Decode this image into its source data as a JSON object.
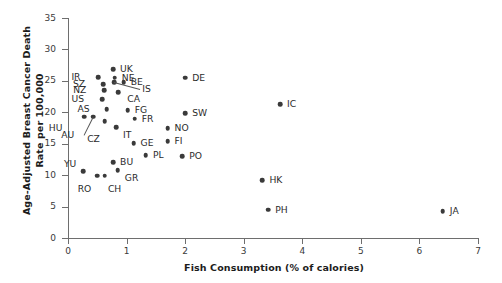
{
  "chart_data": {
    "type": "scatter",
    "title": "",
    "xlabel": "Fish Consumption (% of calories)",
    "ylabel_line1": "Age-Adjusted Breast Cancer Death",
    "ylabel_line2": "Rate per 100,000",
    "xlim": [
      0,
      7
    ],
    "ylim": [
      0,
      35
    ],
    "xticks": [
      "0",
      "1",
      "2",
      "3",
      "4",
      "5",
      "6",
      "7"
    ],
    "yticks": [
      "0",
      "5",
      "10",
      "15",
      "20",
      "25",
      "30",
      "35"
    ],
    "grid": false,
    "legend": "none",
    "marker_color": "#3a3a3a",
    "axis_color": "#6e6e6e",
    "points": [
      {
        "label": "UK",
        "x": 0.77,
        "y": 26.9,
        "lx": 7,
        "ly": -4
      },
      {
        "label": "IR",
        "x": 0.52,
        "y": 25.6,
        "lx": -18,
        "ly": -4
      },
      {
        "label": "NE",
        "x": 0.8,
        "y": 25.5,
        "lx": 7,
        "ly": -4
      },
      {
        "label": "BE",
        "x": 0.95,
        "y": 24.8,
        "lx": 7,
        "ly": -4
      },
      {
        "label": "SZ",
        "x": 0.6,
        "y": 24.5,
        "lx": -18,
        "ly": -4
      },
      {
        "label": "IS",
        "x": 0.79,
        "y": 24.8,
        "lx": 28,
        "ly": 3,
        "leader": true
      },
      {
        "label": "NZ",
        "x": 0.62,
        "y": 23.5,
        "lx": -18,
        "ly": -4
      },
      {
        "label": "CA",
        "x": 0.86,
        "y": 23.2,
        "lx": 9,
        "ly": 3
      },
      {
        "label": "US",
        "x": 0.58,
        "y": 22.1,
        "lx": -18,
        "ly": -4
      },
      {
        "label": "AS",
        "x": 0.66,
        "y": 20.5,
        "lx": -17,
        "ly": -4
      },
      {
        "label": "FG",
        "x": 1.02,
        "y": 20.3,
        "lx": 7,
        "ly": -4
      },
      {
        "label": "FR",
        "x": 1.14,
        "y": 19.0,
        "lx": 7,
        "ly": -4
      },
      {
        "label": "HU",
        "x": 0.28,
        "y": 19.3,
        "lx": -22,
        "ly": 7
      },
      {
        "label": "AU",
        "x": 0.43,
        "y": 19.3,
        "lx": -19,
        "ly": 14,
        "leader": true
      },
      {
        "label": "CZ",
        "x": 0.63,
        "y": 18.6,
        "lx": -5,
        "ly": 14
      },
      {
        "label": "IT",
        "x": 0.82,
        "y": 17.6,
        "lx": 7,
        "ly": 4
      },
      {
        "label": "NO",
        "x": 1.7,
        "y": 17.5,
        "lx": 7,
        "ly": -4
      },
      {
        "label": "GE",
        "x": 1.12,
        "y": 15.1,
        "lx": 7,
        "ly": -4
      },
      {
        "label": "FI",
        "x": 1.7,
        "y": 15.4,
        "lx": 7,
        "ly": -4
      },
      {
        "label": "BU",
        "x": 0.77,
        "y": 12.1,
        "lx": 7,
        "ly": -4
      },
      {
        "label": "PL",
        "x": 1.33,
        "y": 13.2,
        "lx": 7,
        "ly": -4
      },
      {
        "label": "PO",
        "x": 1.95,
        "y": 13.0,
        "lx": 7,
        "ly": -4
      },
      {
        "label": "GR",
        "x": 0.85,
        "y": 10.8,
        "lx": 7,
        "ly": 4
      },
      {
        "label": "YU",
        "x": 0.26,
        "y": 10.6,
        "lx": -7,
        "ly": -11
      },
      {
        "label": "RO",
        "x": 0.5,
        "y": 9.9,
        "lx": -6,
        "ly": 9
      },
      {
        "label": "CH",
        "x": 0.63,
        "y": 9.9,
        "lx": 3,
        "ly": 9
      },
      {
        "label": "DE",
        "x": 2.0,
        "y": 25.5,
        "lx": 7,
        "ly": -4
      },
      {
        "label": "SW",
        "x": 2.0,
        "y": 19.9,
        "lx": 7,
        "ly": -4
      },
      {
        "label": "IC",
        "x": 3.62,
        "y": 21.3,
        "lx": 7,
        "ly": -4
      },
      {
        "label": "HK",
        "x": 3.32,
        "y": 9.2,
        "lx": 7,
        "ly": -4
      },
      {
        "label": "PH",
        "x": 3.42,
        "y": 4.5,
        "lx": 7,
        "ly": -4
      },
      {
        "label": "JA",
        "x": 6.4,
        "y": 4.3,
        "lx": 7,
        "ly": -4
      }
    ]
  }
}
